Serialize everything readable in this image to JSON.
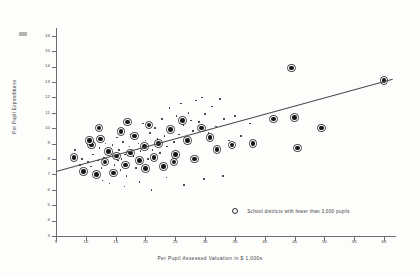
{
  "figure": {
    "background": "#fdfdfc",
    "ink": "#2a2a2a"
  },
  "legend": {
    "marker": "open-circle",
    "text": "School districts with fewer than 3,000 pupils"
  },
  "chart_data": {
    "type": "scatter",
    "title": "",
    "xlabel": "Per Pupil Assessed Valuation in $ 1,000s",
    "ylabel": "Per Pupil Expenditures",
    "xlim": [
      5,
      62
    ],
    "ylim": [
      3,
      16.5
    ],
    "xticks": [
      5,
      10,
      15,
      20,
      25,
      30,
      35,
      40,
      45,
      50,
      55,
      60
    ],
    "yticks": [
      3,
      4,
      5,
      6,
      7,
      8,
      9,
      10,
      11,
      12,
      13,
      14,
      15,
      16
    ],
    "grid": false,
    "legend_position": "inside-lower-right",
    "series": [
      {
        "name": "School districts with 3,000 or more pupils",
        "marker": "small-dot",
        "points": [
          [
            8.2,
            8.6
          ],
          [
            9.0,
            7.6
          ],
          [
            9.4,
            8.0
          ],
          [
            10.1,
            7.3
          ],
          [
            10.4,
            7.8
          ],
          [
            10.9,
            7.5
          ],
          [
            11.2,
            8.3
          ],
          [
            11.6,
            7.1
          ],
          [
            12.0,
            7.9
          ],
          [
            12.3,
            8.7
          ],
          [
            12.6,
            7.4
          ],
          [
            13.0,
            8.1
          ],
          [
            13.3,
            9.0
          ],
          [
            13.6,
            7.7
          ],
          [
            13.9,
            8.4
          ],
          [
            14.2,
            7.2
          ],
          [
            14.5,
            8.9
          ],
          [
            14.8,
            7.6
          ],
          [
            15.0,
            8.2
          ],
          [
            15.2,
            9.4
          ],
          [
            15.4,
            7.9
          ],
          [
            15.6,
            8.6
          ],
          [
            15.8,
            7.3
          ],
          [
            16.0,
            8.0
          ],
          [
            16.2,
            9.1
          ],
          [
            16.4,
            7.5
          ],
          [
            16.6,
            8.3
          ],
          [
            16.8,
            6.9
          ],
          [
            17.0,
            7.7
          ],
          [
            17.3,
            8.8
          ],
          [
            17.6,
            9.6
          ],
          [
            18.0,
            8.2
          ],
          [
            18.4,
            7.4
          ],
          [
            18.8,
            9.0
          ],
          [
            19.2,
            8.5
          ],
          [
            19.6,
            10.3
          ],
          [
            20.0,
            9.2
          ],
          [
            20.4,
            8.0
          ],
          [
            20.8,
            9.7
          ],
          [
            21.2,
            8.6
          ],
          [
            21.6,
            10.0
          ],
          [
            22.0,
            9.3
          ],
          [
            22.4,
            8.4
          ],
          [
            22.8,
            10.6
          ],
          [
            23.2,
            9.5
          ],
          [
            23.6,
            8.8
          ],
          [
            24.0,
            11.3
          ],
          [
            24.4,
            9.9
          ],
          [
            24.8,
            9.1
          ],
          [
            25.2,
            10.8
          ],
          [
            25.6,
            9.6
          ],
          [
            26.0,
            11.6
          ],
          [
            26.4,
            10.2
          ],
          [
            26.8,
            9.4
          ],
          [
            27.2,
            11.0
          ],
          [
            27.6,
            10.5
          ],
          [
            28.0,
            9.8
          ],
          [
            28.5,
            11.8
          ],
          [
            29.0,
            10.4
          ],
          [
            29.5,
            12.0
          ],
          [
            30.0,
            10.9
          ],
          [
            30.6,
            9.7
          ],
          [
            31.2,
            11.4
          ],
          [
            31.8,
            10.1
          ],
          [
            32.5,
            11.9
          ],
          [
            33.2,
            10.6
          ],
          [
            34.0,
            9.2
          ],
          [
            35.0,
            10.8
          ],
          [
            36.0,
            9.5
          ],
          [
            37.5,
            10.3
          ],
          [
            12.8,
            6.6
          ],
          [
            14.0,
            6.4
          ],
          [
            16.5,
            6.2
          ],
          [
            19.0,
            6.5
          ],
          [
            21.0,
            6.0
          ],
          [
            23.5,
            6.8
          ],
          [
            26.5,
            6.3
          ],
          [
            29.8,
            6.7
          ],
          [
            33.0,
            6.9
          ]
        ]
      },
      {
        "name": "School districts with fewer than 3,000 pupils",
        "marker": "ringed-circle",
        "points": [
          [
            8.0,
            8.1
          ],
          [
            9.6,
            7.2
          ],
          [
            11.0,
            8.9
          ],
          [
            11.8,
            7.0
          ],
          [
            12.5,
            9.3
          ],
          [
            13.2,
            7.8
          ],
          [
            13.8,
            8.5
          ],
          [
            14.6,
            7.1
          ],
          [
            15.1,
            8.2
          ],
          [
            15.9,
            9.8
          ],
          [
            16.7,
            7.6
          ],
          [
            17.5,
            8.4
          ],
          [
            18.2,
            9.5
          ],
          [
            19.0,
            7.9
          ],
          [
            19.8,
            8.8
          ],
          [
            20.6,
            10.2
          ],
          [
            21.4,
            8.1
          ],
          [
            22.2,
            9.0
          ],
          [
            23.0,
            7.5
          ],
          [
            24.2,
            9.9
          ],
          [
            25.0,
            8.3
          ],
          [
            26.2,
            10.5
          ],
          [
            27.0,
            9.2
          ],
          [
            28.2,
            8.0
          ],
          [
            29.4,
            10.0
          ],
          [
            30.8,
            9.4
          ],
          [
            32.0,
            8.6
          ],
          [
            34.5,
            8.9
          ],
          [
            38.0,
            9.0
          ],
          [
            41.5,
            10.6
          ],
          [
            44.5,
            13.9
          ],
          [
            45.0,
            10.7
          ],
          [
            45.5,
            8.7
          ],
          [
            49.5,
            10.0
          ],
          [
            60.0,
            13.1
          ],
          [
            10.6,
            9.2
          ],
          [
            12.2,
            10.0
          ],
          [
            17.0,
            10.4
          ],
          [
            20.0,
            7.4
          ],
          [
            24.8,
            7.8
          ]
        ]
      }
    ],
    "trendline": {
      "name": "regression-line",
      "x_start": 5.0,
      "y_start": 7.25,
      "x_end": 61.5,
      "y_end": 13.25
    }
  }
}
